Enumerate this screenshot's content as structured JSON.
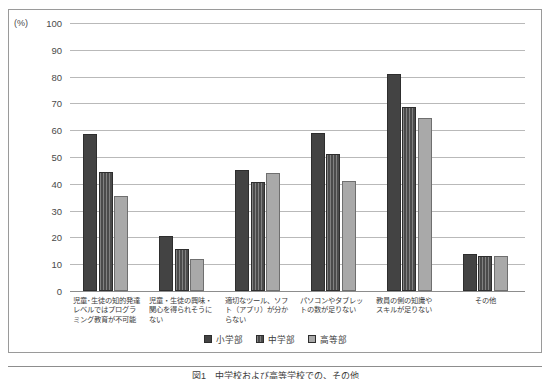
{
  "chart_data": {
    "type": "bar",
    "title": "",
    "xlabel": "",
    "ylabel": "(%)",
    "ylim": [
      0,
      100
    ],
    "yticks": [
      100,
      90,
      80,
      70,
      60,
      50,
      40,
      30,
      20,
      10,
      0
    ],
    "grid": true,
    "legend_position": "bottom",
    "categories": [
      "児童・生徒の知的発達レベルではプログラミング教育が不可能",
      "児童・生徒の興味・関心を得られそうにない",
      "適切なツール、ソフト（アプリ）が分からない",
      "パソコンやタブレットの数が足りない",
      "教員の側の知識やスキルが足りない",
      "その他"
    ],
    "category_lines": [
      [
        "児童･生徒の知的発達",
        "レベルではプログラ",
        "ミング教育が不可能"
      ],
      [
        "児童・生徒の興味・",
        "関心を得られそうに",
        "ない"
      ],
      [
        "適切なツール、ソフ",
        "ト（アプリ）が分か",
        "らない"
      ],
      [
        "パソコンやタブレッ",
        "トの数が足りない"
      ],
      [
        "教員の側の知識や",
        "スキルが足りない"
      ],
      [
        "その他"
      ]
    ],
    "series": [
      {
        "name": "小学部",
        "color": "#434343",
        "values": [
          58.5,
          20.5,
          45.0,
          59.0,
          81.0,
          13.8
        ]
      },
      {
        "name": "中学部",
        "color": "#4b4b4b",
        "values": [
          44.5,
          15.5,
          40.5,
          51.0,
          68.5,
          13.2
        ]
      },
      {
        "name": "高等部",
        "color": "#a9a9a9",
        "values": [
          35.5,
          12.0,
          44.0,
          41.0,
          64.5,
          13.0
        ]
      }
    ]
  },
  "caption": "図1　中学校および高等学校での、その他"
}
